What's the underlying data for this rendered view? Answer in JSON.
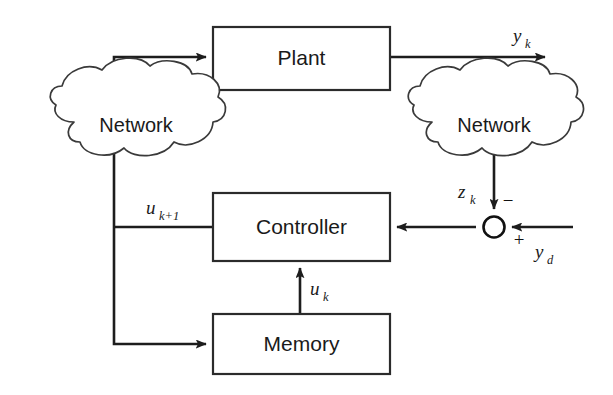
{
  "figure": {
    "kind": "control-system-block-diagram",
    "background_color": "#ffffff",
    "line_color": "#1d1d1d",
    "text_color": "#1a1a1a",
    "width": 613,
    "height": 395
  },
  "blocks": {
    "plant": {
      "label": "Plant"
    },
    "controller": {
      "label": "Controller"
    },
    "memory": {
      "label": "Memory"
    }
  },
  "clouds": {
    "left": {
      "label": "Network"
    },
    "right": {
      "label": "Network"
    }
  },
  "signals": {
    "plant_output": {
      "base": "y",
      "sub": "k"
    },
    "network_output": {
      "base": "z",
      "sub": "k"
    },
    "reference": {
      "base": "y",
      "sub": "d"
    },
    "control_next": {
      "base": "u",
      "sub": "k+1"
    },
    "control_stored": {
      "base": "u",
      "sub": "k"
    }
  },
  "summing_junction": {
    "negative_sign": "−",
    "positive_sign": "+"
  }
}
